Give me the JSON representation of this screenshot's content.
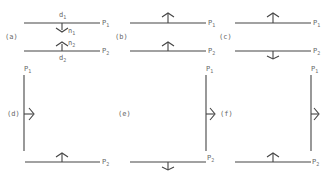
{
  "figure": {
    "panels": [
      {
        "id": "a",
        "label": "(a)",
        "planes": [
          {
            "name": "P",
            "sub": "1",
            "orientation": "horizontal",
            "normal": "down",
            "normal_label": "n",
            "normal_sub": "1",
            "distance_label": "d",
            "distance_sub": "1"
          },
          {
            "name": "P",
            "sub": "2",
            "orientation": "horizontal",
            "normal": "up",
            "normal_label": "n",
            "normal_sub": "2",
            "distance_label": "d",
            "distance_sub": "2"
          }
        ]
      },
      {
        "id": "b",
        "label": "(b)",
        "planes": [
          {
            "name": "P",
            "sub": "1",
            "orientation": "horizontal",
            "normal": "up"
          },
          {
            "name": "P",
            "sub": "2",
            "orientation": "horizontal",
            "normal": "up"
          }
        ]
      },
      {
        "id": "c",
        "label": "(c)",
        "planes": [
          {
            "name": "P",
            "sub": "1",
            "orientation": "horizontal",
            "normal": "up"
          },
          {
            "name": "P",
            "sub": "2",
            "orientation": "horizontal",
            "normal": "down"
          }
        ]
      },
      {
        "id": "d",
        "label": "(d)",
        "planes": [
          {
            "name": "P",
            "sub": "1",
            "orientation": "vertical",
            "normal": "right"
          },
          {
            "name": "P",
            "sub": "2",
            "orientation": "horizontal",
            "normal": "up"
          }
        ]
      },
      {
        "id": "e",
        "label": "(e)",
        "planes": [
          {
            "name": "P",
            "sub": "1",
            "orientation": "vertical",
            "normal": "right"
          },
          {
            "name": "P",
            "sub": "2",
            "orientation": "horizontal",
            "normal": "down"
          }
        ]
      },
      {
        "id": "f",
        "label": "(f)",
        "planes": [
          {
            "name": "P",
            "sub": "1",
            "orientation": "vertical",
            "normal": "right"
          },
          {
            "name": "P",
            "sub": "2",
            "orientation": "horizontal",
            "normal": "up"
          }
        ]
      }
    ]
  }
}
